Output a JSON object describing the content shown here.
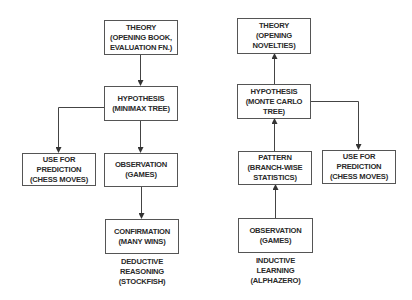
{
  "deductive": {
    "theory": "THEORY\n(OPENING BOOK,\nEVALUATION FN.)",
    "hypothesis": "HYPOTHESIS\n(MINIMAX TREE)",
    "prediction": "USE FOR\nPREDICTION\n(CHESS MOVES)",
    "observation": "OBSERVATION\n(GAMES)",
    "confirmation": "CONFIRMATION\n(MANY WINS)",
    "caption": "DEDUCTIVE\nREASONING\n(STOCKFISH)"
  },
  "inductive": {
    "theory": "THEORY\n(OPENING\nNOVELTIES)",
    "hypothesis": "HYPOTHESIS\n(MONTE CARLO\nTREE)",
    "pattern": "PATTERN\n(BRANCH-WISE\nSTATISTICS)",
    "prediction": "USE FOR\nPREDICTION\n(CHESS MOVES)",
    "observation": "OBSERVATION\n(GAMES)",
    "caption": "INDUCTIVE\nLEARNING\n(ALPHAZERO)"
  },
  "colors": {
    "line": "#444444",
    "border": "#555555",
    "text": "#2a2a2a"
  }
}
